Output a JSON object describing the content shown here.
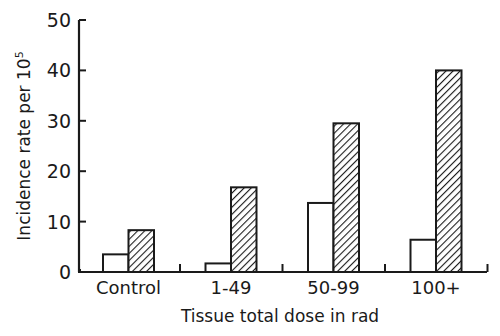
{
  "chart_data": {
    "type": "bar",
    "title": "",
    "xlabel": "Tissue total dose in rad",
    "ylabel": "Incidence rate per 10",
    "ylabel_superscript": "5",
    "ylim": [
      0,
      50
    ],
    "yticks": [
      0,
      10,
      20,
      30,
      40,
      50
    ],
    "grid": false,
    "legend": null,
    "categories": [
      "Control",
      "1-49",
      "50-99",
      "100+"
    ],
    "series": [
      {
        "name": "Open bars",
        "style": "open",
        "values": [
          3.5,
          1.7,
          13.7,
          6.4
        ]
      },
      {
        "name": "Hatched bars",
        "style": "hatched",
        "values": [
          8.3,
          16.8,
          29.5,
          40.0
        ]
      }
    ]
  },
  "colors": {
    "ink": "#1a1a1a",
    "background": "#ffffff"
  }
}
